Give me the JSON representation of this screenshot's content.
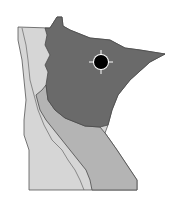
{
  "map": {
    "subject": "Minnesota ecological regions",
    "regions": [
      {
        "name": "Laurentian Mixed Forest",
        "shade": "dark",
        "color": "#6a6a6a"
      },
      {
        "name": "Eastern Broadleaf Forest",
        "shade": "medium",
        "color": "#b4b4b4"
      },
      {
        "name": "Prairie Parkland",
        "shade": "light",
        "color": "#d6d6d6"
      }
    ],
    "border_color": "#4a4a4a",
    "marker": {
      "type": "location-dot",
      "color": "#000000",
      "outline": "#ffffff"
    }
  }
}
